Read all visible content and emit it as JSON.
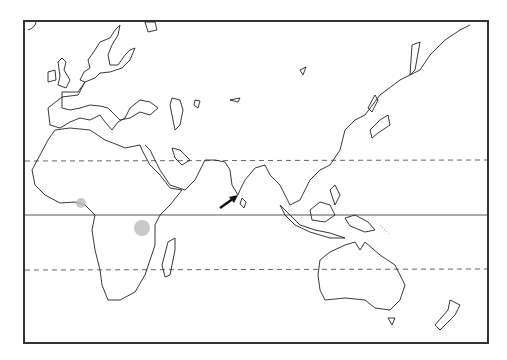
{
  "map": {
    "title": "",
    "projection": "outline map, Old World (Europe, Africa, Asia, Australia)",
    "frame": {
      "x": 23,
      "y": 20,
      "width": 465,
      "height": 323
    },
    "reference_lines": [
      {
        "name": "Tropic of Cancer",
        "style": "dashed",
        "y": 160
      },
      {
        "name": "Equator",
        "style": "solid",
        "y": 215
      },
      {
        "name": "Tropic of Capricorn",
        "style": "dashed",
        "y": 270
      }
    ],
    "highlighted_regions": [
      {
        "name": "West Africa coast (Gulf of Guinea)",
        "style": "shaded"
      },
      {
        "name": "East Africa (Lake Victoria region)",
        "style": "hatched"
      }
    ],
    "markers": [
      {
        "name": "arrow",
        "points_to": "Sri Lanka / southern India"
      }
    ],
    "colors": {
      "line": "#222222",
      "shade": "#bbbbbb",
      "background": "#ffffff"
    }
  }
}
